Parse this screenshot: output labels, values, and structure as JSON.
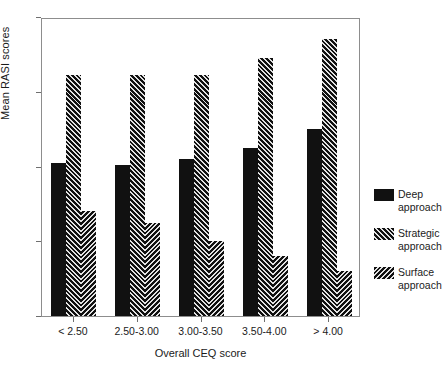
{
  "chart_data": {
    "type": "bar",
    "title": "",
    "xlabel": "Overall CEQ score",
    "ylabel": "Mean RASI scores",
    "ylim": [
      20,
      100
    ],
    "yticks": [
      20,
      40,
      60,
      80,
      100
    ],
    "grid": false,
    "legend_position": "right",
    "categories": [
      "< 2.50",
      "2.50-3.00",
      "3.00-3.50",
      "3.50-4.00",
      "> 4.00"
    ],
    "series": [
      {
        "name": "Deep approach",
        "name_line1": "Deep",
        "name_line2": "approach",
        "pattern": "solid",
        "color": "#111111",
        "values": [
          61,
          60.5,
          62,
          65,
          70
        ]
      },
      {
        "name": "Strategic approach",
        "name_line1": "Strategic",
        "name_line2": "approach",
        "pattern": "diagonal-forward-hatch",
        "color": "#111111",
        "values": [
          84.5,
          84.5,
          84.5,
          89,
          94
        ]
      },
      {
        "name": "Surface approach",
        "name_line1": "Surface",
        "name_line2": "approach",
        "pattern": "diagonal-back-hatch",
        "color": "#111111",
        "values": [
          48,
          45,
          40,
          36,
          32
        ]
      }
    ]
  },
  "axis": {
    "y_title": "Mean RASI scores",
    "x_title": "Overall CEQ score",
    "y_labels": [
      "100",
      "80",
      "60",
      "40",
      "20"
    ]
  }
}
